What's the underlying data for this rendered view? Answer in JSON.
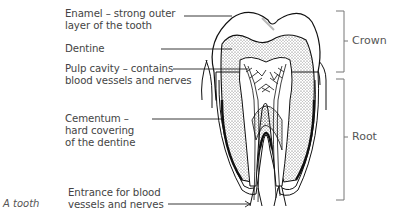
{
  "figure": {
    "caption": "A tooth",
    "labels": {
      "enamel_line1": "Enamel –  strong outer",
      "enamel_line2": "layer of the tooth",
      "dentine": "Dentine",
      "pulp_line1": "Pulp cavity – contains",
      "pulp_line2": "blood vessels and nerves",
      "cementum_line1": "Cementum –",
      "cementum_line2": "hard covering",
      "cementum_line3": "of the dentine",
      "entrance_line1": "Entrance for blood",
      "entrance_line2": "vessels and nerves"
    },
    "regions": {
      "crown": "Crown",
      "root": "Root"
    }
  }
}
